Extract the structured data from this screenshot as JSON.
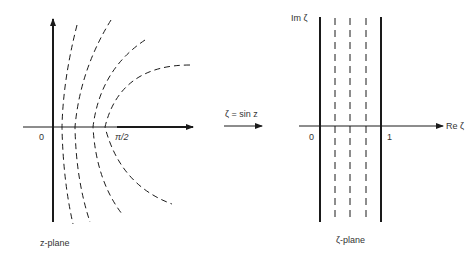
{
  "figure": {
    "mapping_label": "ζ = sin z",
    "left_panel": {
      "caption": "z-plane",
      "origin_label": "0",
      "tick_label": "π/2",
      "description": "Dashed curves (hyperbola-like) in the z-plane crossing the real axis between 0 and π/2"
    },
    "right_panel": {
      "caption": "ζ-plane",
      "origin_label": "0",
      "tick_label": "1",
      "x_axis_label": "Re ζ",
      "y_axis_label": "Im ζ",
      "description": "Vertical strip between Re ζ = 0 and Re ζ = 1 (solid lines) with three dashed vertical lines inside"
    }
  },
  "colors": {
    "line": "#1a1a1a",
    "text": "#333333",
    "background": "#ffffff"
  }
}
